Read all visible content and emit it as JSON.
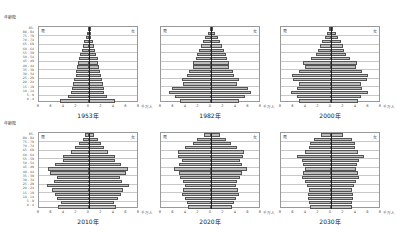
{
  "chart_data": [
    {
      "type": "bar",
      "subtype": "population-pyramid",
      "title": "1953年",
      "ylabel": "年齢階",
      "xlabel": "千万人",
      "categories": [
        "0-4",
        "5-9",
        "10-14",
        "15-19",
        "20-24",
        "25-29",
        "30-34",
        "35-39",
        "40-44",
        "45-49",
        "50-54",
        "55-59",
        "60-64",
        "65-69",
        "70-74",
        "75-79",
        "80-84",
        "85-"
      ],
      "series": [
        {
          "name": "男",
          "values": [
            4.8,
            3.5,
            3.0,
            2.8,
            2.6,
            2.4,
            2.2,
            2.1,
            2.0,
            1.8,
            1.6,
            1.4,
            1.2,
            1.0,
            0.8,
            0.5,
            0.3,
            0.1
          ]
        },
        {
          "name": "女",
          "values": [
            4.2,
            3.0,
            2.5,
            2.4,
            2.3,
            2.1,
            1.9,
            1.8,
            1.7,
            1.5,
            1.4,
            1.2,
            1.0,
            0.8,
            0.6,
            0.4,
            0.2,
            0.1
          ]
        }
      ],
      "xlim": [
        -8,
        8
      ],
      "xticks": [
        "8",
        "6",
        "4",
        "2",
        "0",
        "2",
        "4",
        "6",
        "8"
      ]
    },
    {
      "type": "bar",
      "subtype": "population-pyramid",
      "title": "1982年",
      "xlabel": "千万人",
      "categories": [
        "0-4",
        "5-9",
        "10-14",
        "15-19",
        "20-24",
        "25-29",
        "30-34",
        "35-39",
        "40-44",
        "45-49",
        "50-54",
        "55-59",
        "60-64",
        "65-69",
        "70-74",
        "75-79",
        "80-84",
        "85-"
      ],
      "series": [
        {
          "name": "男",
          "values": [
            5.0,
            5.8,
            6.8,
            6.3,
            4.5,
            4.8,
            3.9,
            3.6,
            3.0,
            2.9,
            2.5,
            2.3,
            2.0,
            1.7,
            1.3,
            0.9,
            0.5,
            0.2
          ]
        },
        {
          "name": "女",
          "values": [
            4.6,
            5.5,
            6.5,
            6.1,
            4.3,
            4.6,
            3.8,
            3.6,
            3.0,
            3.0,
            2.6,
            2.4,
            2.1,
            1.8,
            1.5,
            1.1,
            0.7,
            0.3
          ]
        }
      ],
      "xlim": [
        -8,
        8
      ],
      "xticks": [
        "8",
        "6",
        "4",
        "2",
        "0",
        "2",
        "4",
        "6",
        "8"
      ]
    },
    {
      "type": "bar",
      "subtype": "population-pyramid",
      "title": "2000年",
      "xlabel": "千万人",
      "categories": [
        "0-4",
        "5-9",
        "10-14",
        "15-19",
        "20-24",
        "25-29",
        "30-34",
        "35-39",
        "40-44",
        "45-49",
        "50-54",
        "55-59",
        "60-64",
        "65-69",
        "70-74",
        "75-79",
        "80-84",
        "85-"
      ],
      "series": [
        {
          "name": "男",
          "values": [
            5.2,
            5.5,
            6.5,
            5.6,
            5.3,
            6.2,
            6.4,
            5.3,
            4.3,
            4.5,
            3.2,
            2.5,
            2.2,
            1.8,
            1.5,
            1.0,
            0.6,
            0.3
          ]
        },
        {
          "name": "女",
          "values": [
            4.4,
            4.9,
            6.0,
            5.1,
            4.9,
            5.9,
            6.1,
            5.1,
            4.1,
            4.2,
            3.1,
            2.5,
            2.2,
            1.9,
            1.6,
            1.2,
            0.8,
            0.4
          ]
        }
      ],
      "xlim": [
        -8,
        8
      ],
      "xticks": [
        "8",
        "6",
        "4",
        "2",
        "0",
        "2",
        "4",
        "6",
        "8"
      ]
    },
    {
      "type": "bar",
      "subtype": "population-pyramid",
      "title": "2010年",
      "ylabel": "年齢階",
      "xlabel": "千万人",
      "categories": [
        "0-4",
        "5-9",
        "10-14",
        "15-19",
        "20-24",
        "25-29",
        "30-34",
        "35-39",
        "40-44",
        "45-49",
        "50-54",
        "55-59",
        "60-64",
        "65-69",
        "70-74",
        "75-79",
        "80-84",
        "85-"
      ],
      "series": [
        {
          "name": "男",
          "values": [
            5.0,
            4.6,
            5.2,
            5.6,
            6.0,
            6.9,
            5.7,
            5.3,
            6.3,
            6.7,
            5.6,
            4.3,
            4.3,
            3.0,
            2.3,
            1.7,
            1.0,
            0.6
          ]
        },
        {
          "name": "女",
          "values": [
            4.4,
            4.1,
            4.8,
            5.2,
            5.6,
            6.5,
            5.4,
            5.1,
            6.0,
            6.3,
            5.3,
            4.2,
            4.2,
            3.1,
            2.5,
            2.0,
            1.4,
            0.8
          ]
        }
      ],
      "xlim": [
        -8,
        8
      ],
      "xticks": [
        "8",
        "6",
        "4",
        "2",
        "0",
        "2",
        "4",
        "6",
        "8"
      ]
    },
    {
      "type": "bar",
      "subtype": "population-pyramid",
      "title": "2020年",
      "xlabel": "千万人",
      "categories": [
        "0-4",
        "5-9",
        "10-14",
        "15-19",
        "20-24",
        "25-29",
        "30-34",
        "35-39",
        "40-44",
        "45-49",
        "50-54",
        "55-59",
        "60-64",
        "65-69",
        "70-74",
        "75-79",
        "80-84",
        "85-"
      ],
      "series": [
        {
          "name": "男",
          "values": [
            3.7,
            3.9,
            4.3,
            4.8,
            4.6,
            4.3,
            4.5,
            5.0,
            5.3,
            6.1,
            5.2,
            4.8,
            5.4,
            5.4,
            4.2,
            3.0,
            2.3,
            1.2
          ]
        },
        {
          "name": "女",
          "values": [
            3.5,
            3.7,
            4.1,
            4.6,
            4.4,
            4.1,
            4.3,
            4.8,
            5.1,
            5.9,
            5.0,
            4.7,
            5.3,
            5.4,
            4.3,
            3.2,
            2.5,
            1.5
          ]
        }
      ],
      "xlim": [
        -8,
        8
      ],
      "xticks": [
        "8",
        "6",
        "4",
        "2",
        "0",
        "2",
        "4",
        "6",
        "8"
      ]
    },
    {
      "type": "bar",
      "subtype": "population-pyramid",
      "title": "2030年",
      "xlabel": "千万人",
      "categories": [
        "0-4",
        "5-9",
        "10-14",
        "15-19",
        "20-24",
        "25-29",
        "30-34",
        "35-39",
        "40-44",
        "45-49",
        "50-54",
        "55-59",
        "60-64",
        "65-69",
        "70-74",
        "75-79",
        "80-84",
        "85-"
      ],
      "series": [
        {
          "name": "男",
          "values": [
            3.5,
            3.6,
            3.7,
            3.7,
            3.6,
            3.9,
            4.2,
            4.7,
            4.6,
            4.3,
            4.5,
            4.7,
            5.5,
            4.3,
            3.6,
            3.4,
            2.7,
            1.7
          ]
        },
        {
          "name": "女",
          "values": [
            3.4,
            3.5,
            3.6,
            3.6,
            3.5,
            3.8,
            4.1,
            4.5,
            4.4,
            4.1,
            4.3,
            4.6,
            5.4,
            4.4,
            3.9,
            3.9,
            3.4,
            1.9
          ]
        }
      ],
      "xlim": [
        -8,
        8
      ],
      "xticks": [
        "8",
        "6",
        "4",
        "2",
        "0",
        "2",
        "4",
        "6",
        "8"
      ]
    }
  ],
  "age_axis": {
    "header": "年齢階",
    "labels": [
      "0 - 4",
      "5 - 9",
      "10 - 14",
      "15 - 19",
      "20 - 24",
      "25 - 29",
      "30 - 34",
      "35 - 39",
      "40 - 44",
      "45 - 49",
      "50 - 54",
      "55 - 59",
      "60 - 64",
      "65 - 69",
      "70 - 74",
      "75 - 79",
      "80 - 84",
      "85-"
    ]
  },
  "labels": {
    "male": "男",
    "female": "女",
    "unit": "千万人"
  },
  "colors": {
    "bar_fill": "#bdbdbd",
    "bar_edge": "#555555",
    "axis": "#222222",
    "grid": "#c8c8c8"
  }
}
